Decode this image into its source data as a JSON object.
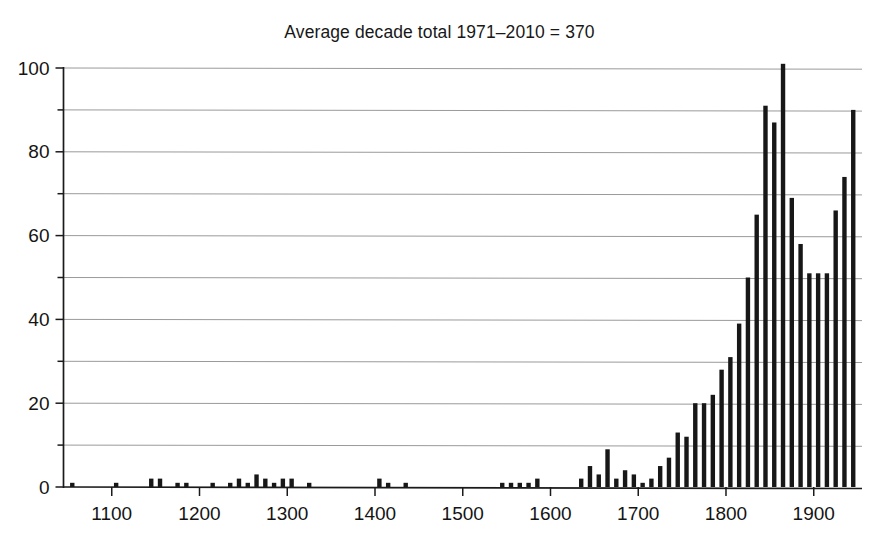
{
  "chart": {
    "title": "Average decade total 1971–2010 = 370",
    "xlabel": "",
    "ylabel": ""
  },
  "chart_data": {
    "type": "bar",
    "title": "Average decade total 1971–2010 = 370",
    "xlabel": "",
    "ylabel": "",
    "xlim": [
      1045,
      1955
    ],
    "ylim": [
      0,
      104
    ],
    "grid": true,
    "legend": false,
    "y_ticks_major": [
      0,
      20,
      40,
      60,
      80,
      100
    ],
    "y_ticks_minor": [
      10,
      30,
      50,
      70,
      90
    ],
    "y_tick_labels": [
      "0",
      "20",
      "40",
      "60",
      "80",
      "100"
    ],
    "x_ticks_major": [
      1100,
      1200,
      1300,
      1400,
      1500,
      1600,
      1700,
      1800,
      1900
    ],
    "x_tick_labels": [
      "1100",
      "1200",
      "1300",
      "1400",
      "1500",
      "1600",
      "1700",
      "1800",
      "1900"
    ],
    "bar_color": "#171717",
    "gridline_color": "#9a9a9a",
    "axis_color": "#1a1a1a",
    "categories": [
      1050,
      1060,
      1070,
      1080,
      1090,
      1100,
      1110,
      1120,
      1130,
      1140,
      1150,
      1160,
      1170,
      1180,
      1190,
      1200,
      1210,
      1220,
      1230,
      1240,
      1250,
      1260,
      1270,
      1280,
      1290,
      1300,
      1310,
      1320,
      1330,
      1340,
      1350,
      1360,
      1370,
      1380,
      1390,
      1400,
      1410,
      1420,
      1430,
      1440,
      1450,
      1460,
      1470,
      1480,
      1490,
      1500,
      1510,
      1520,
      1530,
      1540,
      1550,
      1560,
      1570,
      1580,
      1590,
      1600,
      1610,
      1620,
      1630,
      1640,
      1650,
      1660,
      1670,
      1680,
      1690,
      1700,
      1710,
      1720,
      1730,
      1740,
      1750,
      1760,
      1770,
      1780,
      1790,
      1800,
      1810,
      1820,
      1830,
      1840,
      1850,
      1860,
      1870,
      1880,
      1890,
      1900,
      1910,
      1920,
      1930,
      1940
    ],
    "values": [
      1,
      0,
      0,
      0,
      0,
      1,
      0,
      0,
      0,
      2,
      2,
      0,
      1,
      1,
      0,
      0,
      1,
      0,
      1,
      2,
      1,
      3,
      2,
      1,
      2,
      2,
      0,
      1,
      0,
      0,
      0,
      0,
      0,
      0,
      0,
      2,
      1,
      0,
      1,
      0,
      0,
      0,
      0,
      0,
      0,
      0,
      0,
      0,
      0,
      1,
      1,
      1,
      1,
      2,
      0,
      0,
      0,
      0,
      2,
      5,
      3,
      9,
      2,
      4,
      3,
      1,
      2,
      5,
      7,
      13,
      12,
      20,
      20,
      22,
      28,
      31,
      39,
      50,
      65,
      91,
      87,
      101,
      69,
      58,
      51,
      51,
      51,
      66,
      74,
      90
    ],
    "series": [
      {
        "name": "Decade total",
        "values": [
          1,
          0,
          0,
          0,
          0,
          1,
          0,
          0,
          0,
          2,
          2,
          0,
          1,
          1,
          0,
          0,
          1,
          0,
          1,
          2,
          1,
          3,
          2,
          1,
          2,
          2,
          0,
          1,
          0,
          0,
          0,
          0,
          0,
          0,
          0,
          2,
          1,
          0,
          1,
          0,
          0,
          0,
          0,
          0,
          0,
          0,
          0,
          0,
          0,
          1,
          1,
          1,
          1,
          2,
          0,
          0,
          0,
          0,
          2,
          5,
          3,
          9,
          2,
          4,
          3,
          1,
          2,
          5,
          7,
          13,
          12,
          20,
          20,
          22,
          28,
          31,
          39,
          50,
          65,
          91,
          87,
          101,
          69,
          58,
          51,
          51,
          51,
          66,
          74,
          90
        ]
      }
    ],
    "annotations": [
      "Average decade total 1971–2010 = 370"
    ]
  }
}
